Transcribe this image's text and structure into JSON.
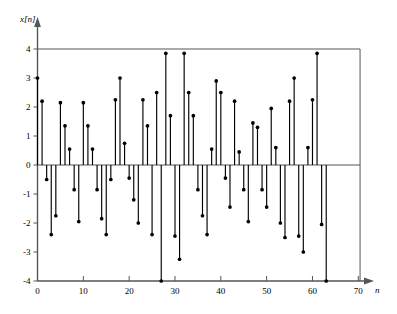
{
  "chart_data": {
    "type": "scatter",
    "subtype": "stem",
    "title": "",
    "subtitle": "",
    "xlabel": "n",
    "ylabel": "x[n]",
    "xlim": [
      -1,
      73
    ],
    "ylim": [
      -4,
      4
    ],
    "grid": false,
    "legend": null,
    "xticks": [
      0,
      10,
      20,
      30,
      40,
      50,
      60,
      70
    ],
    "xtick_labels": [
      "0",
      "10",
      "20",
      "30",
      "40",
      "50",
      "60",
      "70"
    ],
    "yticks": [
      -4,
      -3,
      -2,
      -1,
      0,
      1,
      2,
      3,
      4
    ],
    "ytick_labels": [
      "-4",
      "-3",
      "-2",
      "-1",
      "0",
      "1",
      "2",
      "3",
      "4"
    ],
    "baseline": 0,
    "marker": "filled-circle",
    "line_color": "#000000",
    "marker_color": "#000000",
    "axis_color": "#555555",
    "x": [
      0,
      1,
      2,
      3,
      4,
      5,
      6,
      7,
      8,
      9,
      10,
      11,
      12,
      13,
      14,
      15,
      16,
      17,
      18,
      19,
      20,
      21,
      22,
      23,
      24,
      25,
      26,
      27,
      28,
      29,
      30,
      31,
      32,
      33,
      34,
      35,
      36,
      37,
      38,
      39,
      40,
      41,
      42,
      43,
      44,
      45,
      46,
      47,
      48,
      49,
      50,
      51,
      52,
      53,
      54,
      55,
      56,
      57,
      58,
      59,
      60,
      61,
      62,
      63
    ],
    "values": [
      3.0,
      2.2,
      -0.5,
      -2.4,
      -1.75,
      2.15,
      1.35,
      0.55,
      -0.85,
      -1.95,
      2.15,
      1.35,
      0.55,
      -0.85,
      -1.85,
      -2.4,
      -0.5,
      2.25,
      3.0,
      0.75,
      -0.45,
      -1.2,
      -2.0,
      2.25,
      1.35,
      -2.4,
      2.5,
      -4.0,
      3.85,
      1.7,
      -2.45,
      -3.25,
      3.85,
      2.5,
      1.7,
      -0.85,
      -1.75,
      -2.4,
      0.55,
      2.9,
      2.5,
      -0.45,
      -1.45,
      2.2,
      0.45,
      -0.85,
      -1.95,
      1.45,
      1.3,
      -0.85,
      -1.45,
      1.95,
      0.6,
      -2.0,
      -2.5,
      2.2,
      3.0,
      -2.45,
      -3.0,
      0.6,
      2.25,
      3.85,
      -2.05,
      -4.0
    ]
  },
  "axis": {
    "y_label": "x[n]",
    "x_label": "n"
  }
}
